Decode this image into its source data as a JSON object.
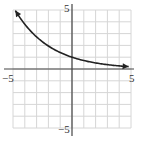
{
  "chart_data": {
    "type": "line",
    "title": "",
    "xlabel": "",
    "ylabel": "",
    "xlim": [
      -5,
      5
    ],
    "ylim": [
      -5,
      5
    ],
    "grid": true,
    "tick_labels": {
      "x_min": "−5",
      "x_max": "5",
      "y_min": "−5",
      "y_max": "5"
    },
    "series": [
      {
        "name": "exponential decay curve",
        "arrows_both_ends": true,
        "x": [
          -4.8,
          -4,
          -3,
          -2,
          -1,
          0,
          1,
          2,
          3,
          4,
          4.8
        ],
        "y": [
          4.95,
          3.79,
          2.72,
          1.95,
          1.4,
          1.0,
          0.72,
          0.51,
          0.37,
          0.26,
          0.2
        ]
      }
    ]
  }
}
